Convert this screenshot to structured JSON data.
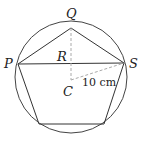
{
  "diagram": {
    "type": "geometry",
    "circle": {
      "cx": 71,
      "cy": 77,
      "r": 56
    },
    "center": {
      "label": "C",
      "x": 71,
      "y": 80
    },
    "vertices": [
      {
        "label": "Q",
        "x": 71,
        "y": 28
      },
      {
        "label": "S",
        "x": 124,
        "y": 63
      },
      {
        "label": "",
        "x": 104,
        "y": 124
      },
      {
        "label": "",
        "x": 39,
        "y": 124
      },
      {
        "label": "P",
        "x": 18,
        "y": 64
      }
    ],
    "chord": {
      "from": "P",
      "to": "S"
    },
    "point_R": {
      "label": "R",
      "x": 71,
      "y": 64
    },
    "radius_label": "10 cm",
    "labels": {
      "Q": "Q",
      "P": "P",
      "S": "S",
      "R": "R",
      "C": "C",
      "radius": "10 cm"
    },
    "colors": {
      "stroke": "#333333",
      "dashed": "#aaaaaa"
    }
  }
}
